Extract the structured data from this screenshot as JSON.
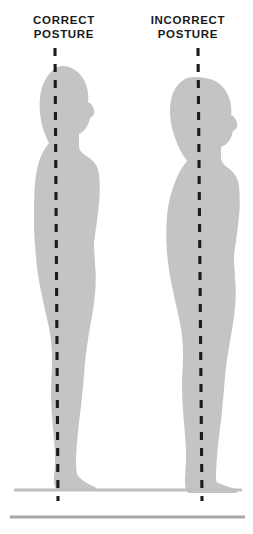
{
  "figure": {
    "title_left": "CORRECT POSTURE",
    "title_right": "INCORRECT POSTURE",
    "labels": {
      "left": {
        "line1": "CORRECT",
        "line2": "POSTURE"
      },
      "right": {
        "line1": "INCORRECT",
        "line2": "POSTURE"
      }
    },
    "colors": {
      "background": "#ffffff",
      "silhouette": "#c4c4c4",
      "plumb_line": "#1b1b1b",
      "floor_line_upper": "#bfbfbf",
      "floor_line_lower": "#a8a8a8",
      "label_text": "#1b1b1b"
    },
    "elements": {
      "left_silhouette_name": "correct-posture-silhouette",
      "right_silhouette_name": "incorrect-posture-silhouette",
      "left_plumb_line_name": "correct-posture-plumb-line",
      "right_plumb_line_name": "incorrect-posture-plumb-line",
      "floor_upper_name": "floor-line-upper",
      "floor_lower_name": "floor-line-lower"
    },
    "geometry": {
      "canvas_width": 253,
      "canvas_height": 534,
      "left_plumb_x_top": 55,
      "left_plumb_x_bottom": 58,
      "right_plumb_x_top": 198,
      "right_plumb_x_bottom": 202,
      "plumb_y_top": 48,
      "plumb_y_bottom": 500,
      "floor_upper_y": 488,
      "floor_lower_y": 516,
      "figure_facing": "right"
    }
  }
}
